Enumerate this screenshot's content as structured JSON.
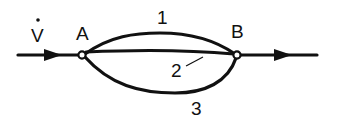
{
  "diagram": {
    "type": "flow-network",
    "colors": {
      "line": "#111111",
      "background": "#ffffff"
    },
    "labels": {
      "flow": "V",
      "flow_symbol": "volume-flow-rate-dot",
      "node_a": "A",
      "node_b": "B",
      "path_1": "1",
      "path_2": "2",
      "path_3": "3"
    },
    "nodes": [
      {
        "id": "A",
        "label": "A"
      },
      {
        "id": "B",
        "label": "B"
      }
    ],
    "edges": [
      {
        "id": "inlet",
        "from": "in",
        "to": "A",
        "arrow": "forward"
      },
      {
        "id": "path-1",
        "from": "A",
        "to": "B",
        "label": "1",
        "shape": "arc-upper"
      },
      {
        "id": "path-2",
        "from": "A",
        "to": "B",
        "label": "2",
        "shape": "straight"
      },
      {
        "id": "path-3",
        "from": "A",
        "to": "B",
        "label": "3",
        "shape": "arc-lower"
      },
      {
        "id": "outlet",
        "from": "B",
        "to": "out",
        "arrow": "forward"
      }
    ]
  }
}
